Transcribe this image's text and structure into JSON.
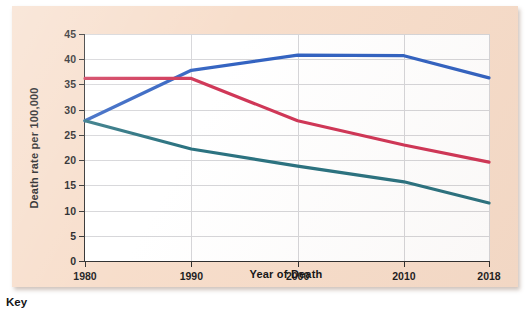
{
  "figure": {
    "key_label": "Key",
    "background_color": "#f7ddca",
    "plot_background_color": "#ffffff"
  },
  "chart_data": {
    "type": "line",
    "title": "",
    "xlabel": "Year of Death",
    "ylabel": "Death rate per 100,000",
    "x": [
      1980,
      1990,
      2000,
      2010,
      2018
    ],
    "xtick_labels": [
      "1980",
      "1990",
      "2000",
      "2010",
      "2018"
    ],
    "ytick_labels": [
      "0",
      "5",
      "10",
      "15",
      "20",
      "25",
      "30",
      "35",
      "40",
      "45"
    ],
    "yticks": [
      0,
      5,
      10,
      15,
      20,
      25,
      30,
      35,
      40,
      45
    ],
    "ylim": [
      0,
      45
    ],
    "grid": true,
    "legend": "none",
    "series": [
      {
        "name": "blue-series",
        "color": "#2f60c0",
        "values": [
          27.8,
          37.8,
          40.8,
          40.7,
          36.3
        ]
      },
      {
        "name": "red-series",
        "color": "#cf3354",
        "values": [
          36.2,
          36.2,
          27.8,
          23.0,
          19.6
        ]
      },
      {
        "name": "teal-series",
        "color": "#27707e",
        "values": [
          27.8,
          22.2,
          18.8,
          15.7,
          11.5
        ]
      }
    ]
  }
}
